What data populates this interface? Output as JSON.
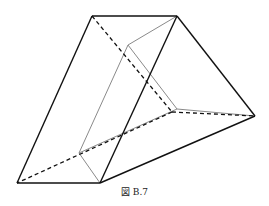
{
  "figure": {
    "caption": "図 B.7",
    "colors": {
      "edge": "#111111",
      "inner": "#8a8a8a",
      "background": "#ffffff"
    },
    "vertices": {
      "A": [
        92,
        16
      ],
      "B": [
        177,
        16
      ],
      "C": [
        255,
        116
      ],
      "D": [
        17,
        183
      ],
      "E": [
        100,
        183
      ],
      "F": [
        172,
        112
      ],
      "G1": [
        128,
        45
      ],
      "G2": [
        177,
        109
      ],
      "G3": [
        79,
        153
      ]
    }
  }
}
